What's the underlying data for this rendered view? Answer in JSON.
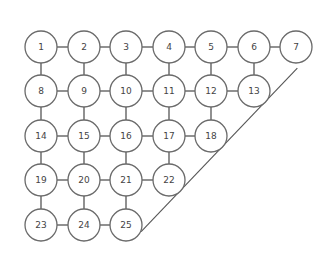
{
  "diagram": {
    "type": "triangular grid graph",
    "colors": {
      "stroke": "#6a6a6a",
      "text": "#444444",
      "background": "#ffffff"
    },
    "rows": [
      {
        "y": 47,
        "nodes": [
          {
            "id": "1",
            "x": 41
          },
          {
            "id": "2",
            "x": 84
          },
          {
            "id": "3",
            "x": 126
          },
          {
            "id": "4",
            "x": 169
          },
          {
            "id": "5",
            "x": 211
          },
          {
            "id": "6",
            "x": 254
          },
          {
            "id": "7",
            "x": 296
          }
        ]
      },
      {
        "y": 91,
        "nodes": [
          {
            "id": "8",
            "x": 41
          },
          {
            "id": "9",
            "x": 84
          },
          {
            "id": "10",
            "x": 126
          },
          {
            "id": "11",
            "x": 169
          },
          {
            "id": "12",
            "x": 211
          },
          {
            "id": "13",
            "x": 254
          }
        ]
      },
      {
        "y": 136,
        "nodes": [
          {
            "id": "14",
            "x": 41
          },
          {
            "id": "15",
            "x": 84
          },
          {
            "id": "16",
            "x": 126
          },
          {
            "id": "17",
            "x": 169
          },
          {
            "id": "18",
            "x": 211
          }
        ]
      },
      {
        "y": 180,
        "nodes": [
          {
            "id": "19",
            "x": 41
          },
          {
            "id": "20",
            "x": 84
          },
          {
            "id": "21",
            "x": 126
          },
          {
            "id": "22",
            "x": 169
          }
        ]
      },
      {
        "y": 225,
        "nodes": [
          {
            "id": "23",
            "x": 41
          },
          {
            "id": "24",
            "x": 84
          },
          {
            "id": "25",
            "x": 126
          }
        ]
      }
    ],
    "diagonal": {
      "from": "25",
      "to": "7",
      "passes": [
        "22",
        "18",
        "13"
      ]
    }
  }
}
